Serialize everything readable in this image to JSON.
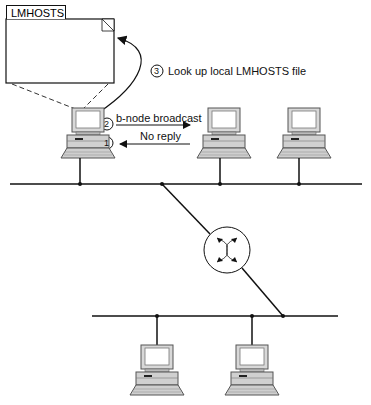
{
  "diagram": {
    "file_label": "LMHOSTS",
    "steps": [
      {
        "num": "1",
        "label": "No reply"
      },
      {
        "num": "2",
        "label": "b-node broadcast"
      },
      {
        "num": "3",
        "label": "Look up local LMHOSTS file"
      }
    ],
    "nodes": [
      "computer-source",
      "computer-2",
      "computer-3",
      "computer-4",
      "computer-5"
    ],
    "router_icon": "router-icon"
  }
}
